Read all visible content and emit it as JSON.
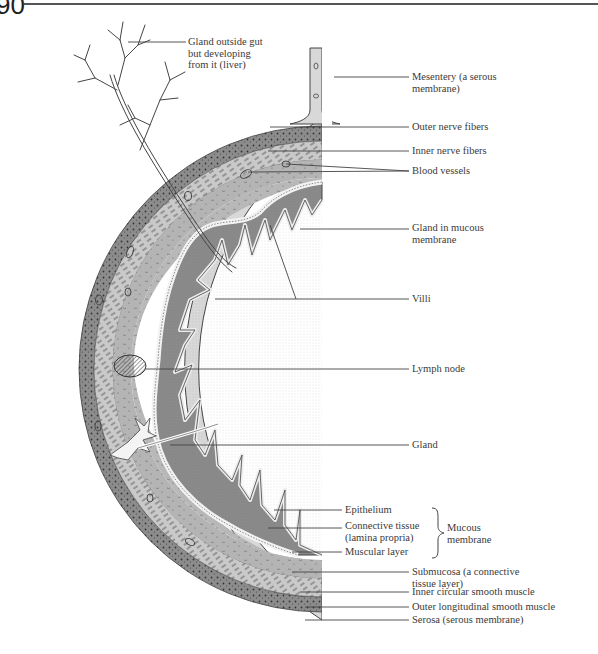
{
  "page": {
    "number": "90"
  },
  "diagram": {
    "labels": {
      "liver": "Gland outside gut\nbut developing\nfrom it (liver)",
      "mesentery": "Mesentery (a serous\nmembrane)",
      "outer_nerve": "Outer nerve fibers",
      "inner_nerve": "Inner nerve fibers",
      "blood_vessels": "Blood vessels",
      "gland_mucous": "Gland in mucous\nmembrane",
      "villi": "Villi",
      "lymph_node": "Lymph node",
      "gland": "Gland",
      "epithelium": "Epithelium",
      "connective": "Connective tissue\n(lamina propria)",
      "muscular": "Muscular layer",
      "mucous_group": "Mucous\nmembrane",
      "submucosa": "Submucosa (a connective\ntissue layer)",
      "inner_circular": "Inner circular smooth muscle",
      "outer_longitudinal": "Outer longitudinal smooth muscle",
      "serosa": "Serosa (serous membrane)"
    },
    "colors": {
      "serosa": "#d8d8d8",
      "outer_muscle": "#8c8c8c",
      "inner_muscle": "#c9c9c9",
      "submucosa": "#b4b4b4",
      "mucosa": "#8a8a8a",
      "epithelium": "#f2f2f2",
      "outline": "#444444"
    }
  }
}
